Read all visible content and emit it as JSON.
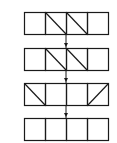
{
  "diagram": {
    "stroke_color": "#1a1a1a",
    "background": "#ffffff",
    "box_width": 21,
    "box_height": 22,
    "origin_x": 24,
    "arrow_x": 66,
    "rows": [
      {
        "y": 12,
        "cells": [
          "empty",
          "diag-down",
          "diag-down",
          "empty"
        ]
      },
      {
        "y": 48,
        "cells": [
          "empty",
          "diag-down",
          "diag-down",
          "empty"
        ]
      },
      {
        "y": 83,
        "cells": [
          "diag-down",
          "empty",
          "empty",
          "diag-up"
        ]
      },
      {
        "y": 118,
        "cells": [
          "empty",
          "empty",
          "empty",
          "empty"
        ]
      }
    ]
  }
}
